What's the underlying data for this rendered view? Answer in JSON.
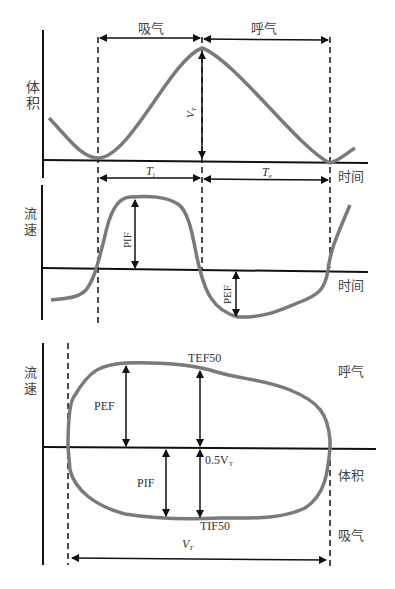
{
  "colors": {
    "curve": "#7a7a7a",
    "axis": "#111111",
    "text": "#333333"
  },
  "panel1": {
    "ylabel_1": "体",
    "ylabel_2": "积",
    "xlabel": "时间",
    "inhale": "吸气",
    "exhale": "呼气",
    "vt": "V",
    "vt_sub": "T",
    "ti": "T",
    "ti_sub": "i",
    "te": "T",
    "te_sub": "e"
  },
  "panel2": {
    "ylabel_1": "流",
    "ylabel_2": "速",
    "xlabel": "时间",
    "pif": "PIF",
    "pef": "PEF"
  },
  "panel3": {
    "ylabel_1": "流",
    "ylabel_2": "速",
    "xlabel": "体积",
    "exhale": "呼气",
    "inhale": "吸气",
    "tef50": "TEF50",
    "tif50": "TIF50",
    "pef": "PEF",
    "pif": "PIF",
    "half_vt": "0.5V",
    "half_vt_sub": "T",
    "vt": "V",
    "vt_sub": "T"
  }
}
